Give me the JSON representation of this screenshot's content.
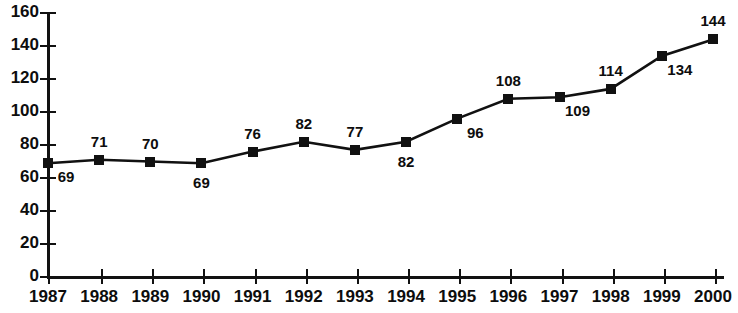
{
  "chart_data": {
    "type": "line",
    "title": "",
    "subtitle": "",
    "xlabel": "",
    "ylabel": "",
    "categories": [
      "1987",
      "1988",
      "1989",
      "1990",
      "1991",
      "1992",
      "1993",
      "1994",
      "1995",
      "1996",
      "1997",
      "1998",
      "1999",
      "2000"
    ],
    "values": [
      69,
      71,
      70,
      69,
      76,
      82,
      77,
      82,
      96,
      108,
      109,
      114,
      134,
      144
    ],
    "point_labels": [
      "69",
      "71",
      "70",
      "69",
      "76",
      "82",
      "77",
      "82",
      "96",
      "108",
      "109",
      "114",
      "134",
      "144"
    ],
    "label_positions": [
      "below-right",
      "above",
      "above",
      "below",
      "above",
      "above",
      "above",
      "below",
      "below-right",
      "above",
      "below-right",
      "above",
      "below-right",
      "above"
    ],
    "ylim": [
      0,
      160
    ],
    "ytick_labels": [
      "0",
      "20",
      "40",
      "60",
      "80",
      "100",
      "120",
      "140",
      "160"
    ],
    "ytick_values": [
      0,
      20,
      40,
      60,
      80,
      100,
      120,
      140,
      160
    ],
    "grid": false,
    "legend": null,
    "legend_position": "none",
    "marker": "filled-square",
    "series_color": "#111111",
    "axis_color": "#111111",
    "background_color": "#ffffff"
  }
}
